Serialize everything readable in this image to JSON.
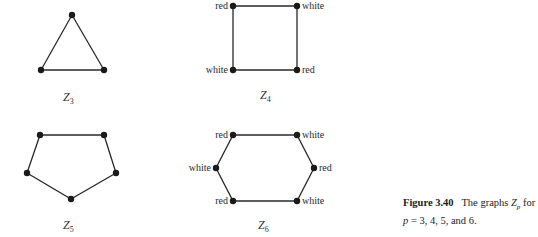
{
  "graphs": {
    "z3": {
      "name": "Z",
      "sub": "3"
    },
    "z4": {
      "name": "Z",
      "sub": "4",
      "labels": {
        "top_left": "red",
        "top_right": "white",
        "bottom_left": "white",
        "bottom_right": "red"
      }
    },
    "z5": {
      "name": "Z",
      "sub": "5"
    },
    "z6": {
      "name": "Z",
      "sub": "6",
      "labels": {
        "top_left": "red",
        "top_right": "white",
        "left": "white",
        "right": "red",
        "bottom_left": "red",
        "bottom_right": "white"
      }
    }
  },
  "caption": {
    "figure": "Figure 3.40",
    "text_1": "The graphs ",
    "var": "Z",
    "var_sub": "p",
    "text_2": " for ",
    "p_var": "p",
    "text_3": " = 3, 4, 5, and 6."
  }
}
